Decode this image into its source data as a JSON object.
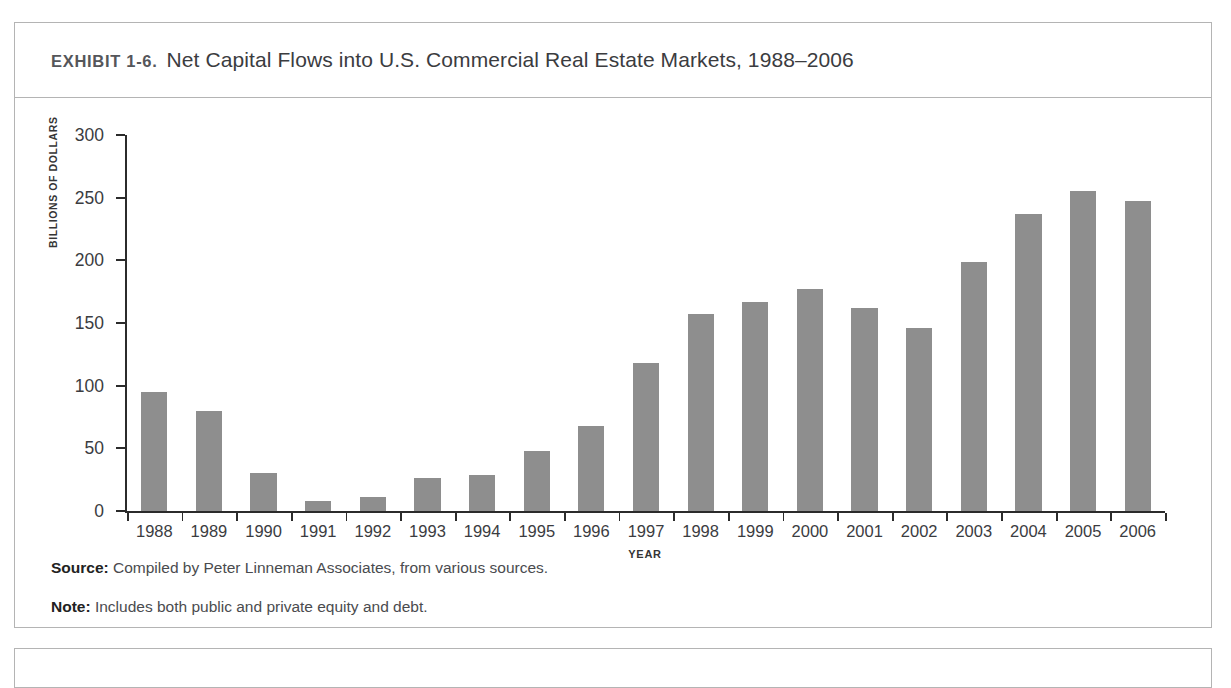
{
  "exhibit": {
    "label": "EXHIBIT 1-6.",
    "title": "Net Capital Flows into U.S. Commercial Real Estate Markets, 1988–2006"
  },
  "footnotes": {
    "source_label": "Source:",
    "source_text": " Compiled by Peter Linneman Associates, from various sources.",
    "note_label": "Note:",
    "note_text": " Includes both public and private equity and debt."
  },
  "colors": {
    "bar": "#8e8e8e",
    "axis": "#2b2b2b",
    "border": "#b4b4b4",
    "text": "#3b3c3f"
  },
  "chart_data": {
    "type": "bar",
    "title": "Net Capital Flows into U.S. Commercial Real Estate Markets, 1988–2006",
    "xlabel": "YEAR",
    "ylabel": "BILLIONS OF DOLLARS",
    "ylim": [
      0,
      300
    ],
    "yticks": [
      0,
      50,
      100,
      150,
      200,
      250,
      300
    ],
    "ytick_labels": [
      "0",
      "50",
      "100",
      "150",
      "200",
      "250",
      "300"
    ],
    "grid": false,
    "legend": null,
    "categories": [
      "1988",
      "1989",
      "1990",
      "1991",
      "1992",
      "1993",
      "1994",
      "1995",
      "1996",
      "1997",
      "1998",
      "1999",
      "2000",
      "2001",
      "2002",
      "2003",
      "2004",
      "2005",
      "2006"
    ],
    "values": [
      95,
      80,
      30,
      8,
      11,
      26,
      29,
      48,
      68,
      118,
      157,
      167,
      177,
      162,
      146,
      199,
      237,
      255,
      247
    ],
    "units": "Billions of dollars"
  }
}
